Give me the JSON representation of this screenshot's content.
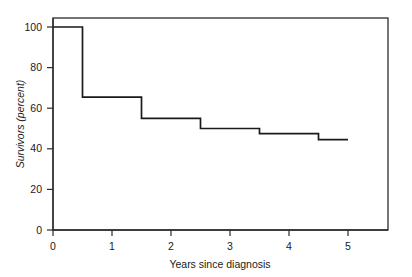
{
  "figure": {
    "background_color": "#ffffff",
    "line_color": "#1a1a1a",
    "axis_color": "#2b2b2b"
  },
  "chart_data": {
    "type": "line",
    "subtype": "step",
    "title": "",
    "subtitle": "",
    "xlabel": "Years since diagnosis",
    "ylabel": "Survivors (percent)",
    "xlim": [
      0,
      5
    ],
    "ylim": [
      0,
      100
    ],
    "xticks": [
      0,
      1,
      2,
      3,
      4,
      5
    ],
    "xtick_labels": [
      "0",
      "1",
      "2",
      "3",
      "4",
      "5"
    ],
    "yticks": [
      0,
      20,
      40,
      60,
      80,
      100
    ],
    "ytick_labels": [
      "0",
      "20",
      "40",
      "60",
      "80",
      "100"
    ],
    "grid": false,
    "legend": false,
    "legend_position": "none",
    "frame": "box",
    "series": [
      {
        "name": "Survivors",
        "step_mode": "post",
        "x": [
          0,
          0.5,
          1.5,
          2.5,
          3.5,
          4.5,
          5
        ],
        "y": [
          100,
          65.5,
          55,
          50,
          47.5,
          44.5,
          44.5
        ],
        "points": [
          {
            "x": 0,
            "y": 100,
            "label": "0 yr: 100%"
          },
          {
            "x": 0.5,
            "y": 65.5,
            "label": "0.5 yr: 65.5%"
          },
          {
            "x": 1.5,
            "y": 55,
            "label": "1.5 yr: 55%"
          },
          {
            "x": 2.5,
            "y": 50,
            "label": "2.5 yr: 50%"
          },
          {
            "x": 3.5,
            "y": 47.5,
            "label": "3.5 yr: 47.5%"
          },
          {
            "x": 4.5,
            "y": 44.5,
            "label": "4.5 yr: 44.5%"
          },
          {
            "x": 5,
            "y": 44.5,
            "label": "5 yr: 44.5%"
          }
        ]
      }
    ],
    "annotations": []
  },
  "axes": {
    "y_tick_0": "0",
    "y_tick_20": "20",
    "y_tick_40": "40",
    "y_tick_60": "60",
    "y_tick_80": "80",
    "y_tick_100": "100",
    "x_tick_0": "0",
    "x_tick_1": "1",
    "x_tick_2": "2",
    "x_tick_3": "3",
    "x_tick_4": "4",
    "x_tick_5": "5",
    "y_axis_title": "Survivors (percent)",
    "x_axis_title": "Years since diagnosis"
  }
}
